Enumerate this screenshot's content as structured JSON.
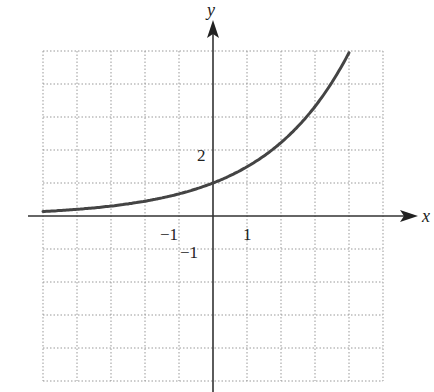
{
  "chart_data": {
    "type": "line",
    "title": "",
    "xlabel": "x",
    "ylabel": "y",
    "xlim": [
      -5,
      5
    ],
    "ylim": [
      -5,
      5
    ],
    "grid": true,
    "grid_style": "dotted",
    "tick_labels": {
      "x": [
        {
          "value": -1,
          "label": "−1"
        },
        {
          "value": 1,
          "label": "1"
        }
      ],
      "y": [
        {
          "value": 2,
          "label": "2"
        },
        {
          "value": -1,
          "label": "−1"
        }
      ]
    },
    "series": [
      {
        "name": "exponential curve",
        "color": "#444444",
        "x": [
          -5,
          -4,
          -3,
          -2,
          -1,
          0,
          1,
          2,
          3,
          4
        ],
        "y": [
          0.14,
          0.2,
          0.3,
          0.45,
          0.67,
          1.0,
          1.49,
          2.23,
          3.32,
          4.95
        ]
      }
    ]
  },
  "axes": {
    "x_label": "x",
    "y_label": "y",
    "tick_x_neg1": "−1",
    "tick_x_1": "1",
    "tick_y_2": "2",
    "tick_y_neg1": "−1"
  }
}
